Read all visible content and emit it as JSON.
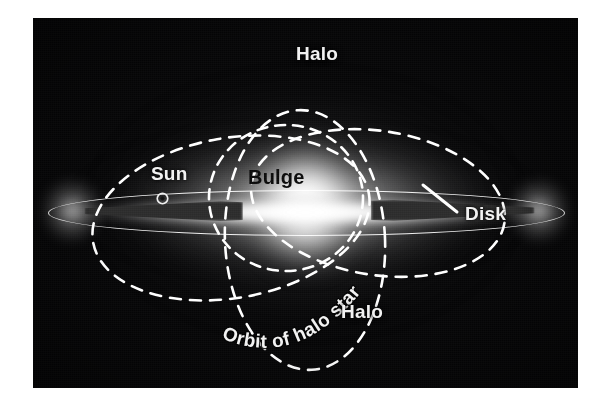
{
  "figure": {
    "plate_background": "#050506",
    "label_color_light": "#f2f2f2",
    "label_color_dark": "#0a0a0a",
    "orbit_stroke": "#ffffff"
  },
  "labels": {
    "halo_top": "Halo",
    "halo_bottom": "Halo",
    "sun": "Sun",
    "bulge": "Bulge",
    "disk": "Disk",
    "orbit": "Orbit of halo star"
  },
  "components": [
    {
      "name": "halo",
      "label": "Halo",
      "text_color": "#f2f2f2"
    },
    {
      "name": "bulge",
      "label": "Bulge",
      "text_color": "#0a0a0a"
    },
    {
      "name": "disk",
      "label": "Disk",
      "text_color": "#f2f2f2"
    },
    {
      "name": "sun",
      "label": "Sun",
      "text_color": "#f2f2f2"
    },
    {
      "name": "orbit-of-halo-star",
      "label": "Orbit of halo star",
      "text_color": "#f2f2f2"
    }
  ]
}
